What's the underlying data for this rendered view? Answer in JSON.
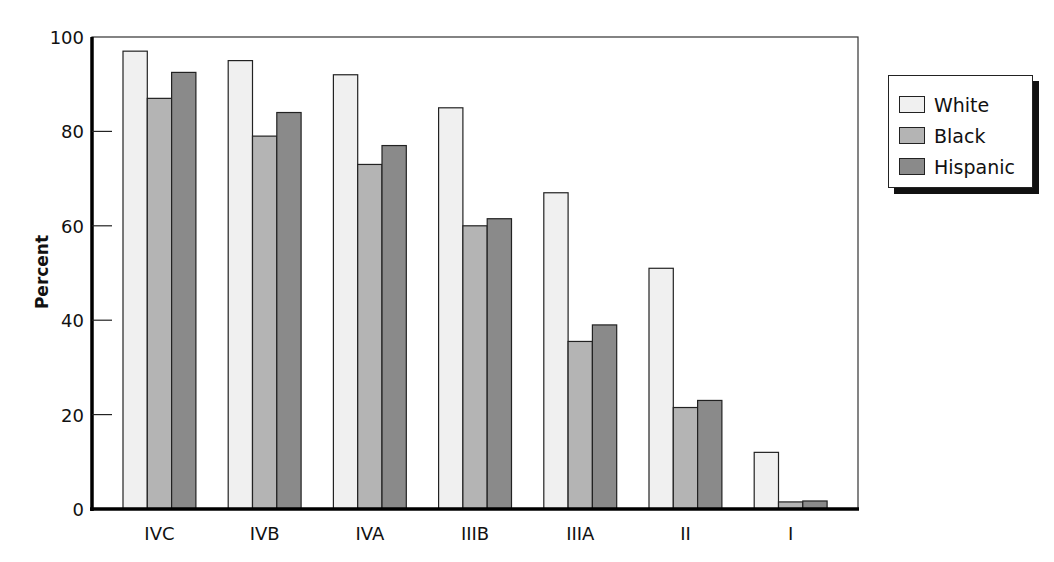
{
  "chart_data": {
    "type": "bar",
    "title": "",
    "xlabel": "",
    "ylabel": "Percent",
    "ylim": [
      0,
      100
    ],
    "yticks": [
      0,
      20,
      40,
      60,
      80,
      100
    ],
    "grid": false,
    "legend_position": "right",
    "categories": [
      "IVC",
      "IVB",
      "IVA",
      "IIIB",
      "IIIA",
      "II",
      "I"
    ],
    "series": [
      {
        "name": "White",
        "color": "#f0f0f0",
        "values": [
          97,
          95,
          92,
          85,
          67,
          51,
          12
        ]
      },
      {
        "name": "Black",
        "color": "#b4b4b4",
        "values": [
          87,
          79,
          73,
          60,
          35.5,
          21.5,
          1.5
        ]
      },
      {
        "name": "Hispanic",
        "color": "#8a8a8a",
        "values": [
          92.5,
          84,
          77,
          61.5,
          39,
          23,
          1.7
        ]
      }
    ]
  },
  "legend": {
    "items": [
      {
        "label": "White",
        "color": "#f0f0f0"
      },
      {
        "label": "Black",
        "color": "#b4b4b4"
      },
      {
        "label": "Hispanic",
        "color": "#8a8a8a"
      }
    ]
  }
}
